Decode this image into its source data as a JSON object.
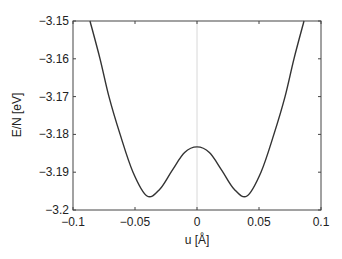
{
  "chart_data": {
    "type": "line",
    "title": "",
    "xlabel": "u [Å]",
    "ylabel": "E/N [eV]",
    "xlim": [
      -0.1,
      0.1
    ],
    "ylim": [
      -3.2,
      -3.15
    ],
    "xticks": [
      "-0.1",
      "-0.05",
      "0",
      "0.05",
      "0.1"
    ],
    "yticks": [
      "-3.15",
      "-3.16",
      "-3.17",
      "-3.18",
      "-3.19",
      "-3.2"
    ],
    "grid": false,
    "vertical_reference_line_at": 0,
    "series": [
      {
        "name": "E/N",
        "color": "#333333",
        "x": [
          -0.0863,
          -0.0782,
          -0.071,
          -0.062,
          -0.0516,
          -0.0403,
          -0.03,
          -0.02,
          -0.01,
          0,
          0.01,
          0.02,
          0.03,
          0.0403,
          0.0516,
          0.062,
          0.071,
          0.0782,
          0.0863
        ],
        "y": [
          -3.15,
          -3.16,
          -3.17,
          -3.18,
          -3.19,
          -3.1963,
          -3.1945,
          -3.1895,
          -3.1848,
          -3.1833,
          -3.1848,
          -3.1895,
          -3.1945,
          -3.1963,
          -3.19,
          -3.18,
          -3.17,
          -3.16,
          -3.15
        ]
      }
    ]
  }
}
